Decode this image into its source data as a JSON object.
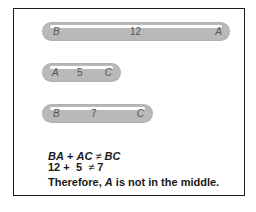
{
  "diagram": {
    "segments": [
      {
        "left": "B",
        "value": "12",
        "right": "A"
      },
      {
        "left": "A",
        "value": "5",
        "right": "C"
      },
      {
        "left": "B",
        "value": "7",
        "right": "C"
      }
    ],
    "equation1": {
      "a": "BA",
      "plus": "+",
      "b": "AC",
      "neq": "≠",
      "c": "BC"
    },
    "equation2": {
      "a": "12",
      "plus": "+",
      "b": "5",
      "neq": "≠",
      "c": "7"
    },
    "conclusion": {
      "prefix": "Therefore, ",
      "point": "A",
      "suffix": " is not in the middle."
    }
  }
}
